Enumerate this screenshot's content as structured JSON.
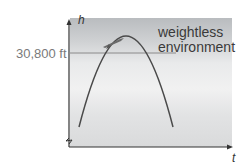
{
  "diagram": {
    "y_axis_label": "h",
    "x_axis_label": "t",
    "reference_line_label": "30,800 ft",
    "annotation_line1": "weightless",
    "annotation_line2": "environment",
    "colors": {
      "curve": "#4a4a4a",
      "axis": "#333333",
      "reference": "#8a8a8a"
    }
  }
}
